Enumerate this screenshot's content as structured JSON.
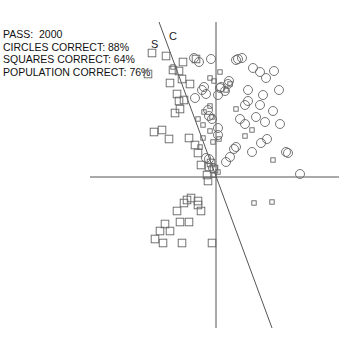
{
  "info": {
    "pass_label": "PASS:",
    "pass_value": "2000",
    "circles_correct": "CIRCLES CORRECT: 88%",
    "squares_correct": "SQUARES CORRECT: 64%",
    "population_correct": "POPULATION CORRECT: 76%"
  },
  "chart_data": {
    "type": "scatter",
    "title": "",
    "xlabel": "",
    "ylabel": "",
    "xlim": [
      -126,
      123
    ],
    "ylim": [
      -151,
      155
    ],
    "grid": false,
    "axes_through_origin": true,
    "decision_boundary": {
      "points": [
        [
          -57,
          155
        ],
        [
          56,
          -151
        ]
      ],
      "side_labels": {
        "left": "S",
        "right": "C"
      }
    },
    "series": [
      {
        "name": "circles",
        "marker": "circle",
        "size": "large",
        "points": [
          [
            -22,
            119
          ],
          [
            -17,
            115
          ],
          [
            -5,
            118
          ],
          [
            22,
            118
          ],
          [
            26,
            119
          ],
          [
            20,
            117
          ],
          [
            37,
            109
          ],
          [
            44,
            105
          ],
          [
            58,
            106
          ],
          [
            50,
            99
          ],
          [
            -12,
            90
          ],
          [
            -14,
            87
          ],
          [
            5,
            90
          ],
          [
            4,
            89
          ],
          [
            13,
            96
          ],
          [
            12,
            93
          ],
          [
            -10,
            83
          ],
          [
            -21,
            79
          ],
          [
            2,
            82
          ],
          [
            32,
            87
          ],
          [
            47,
            82
          ],
          [
            63,
            87
          ],
          [
            9,
            86
          ],
          [
            44,
            72
          ],
          [
            57,
            66
          ],
          [
            40,
            60
          ],
          [
            64,
            53
          ],
          [
            32,
            76
          ],
          [
            29,
            72
          ],
          [
            49,
            55
          ],
          [
            2,
            42
          ],
          [
            24,
            58
          ],
          [
            29,
            53
          ],
          [
            51,
            38
          ],
          [
            45,
            34
          ],
          [
            36,
            25
          ],
          [
            20,
            30
          ],
          [
            18,
            28
          ],
          [
            70,
            25
          ],
          [
            72,
            24
          ],
          [
            -7,
            61
          ],
          [
            -4,
            58
          ],
          [
            -8,
            67
          ],
          [
            2,
            49
          ],
          [
            14,
            20
          ],
          [
            -7,
            18
          ],
          [
            -10,
            19
          ],
          [
            10,
            15
          ],
          [
            -3,
            9
          ],
          [
            84,
            3
          ]
        ]
      },
      {
        "name": "squares",
        "marker": "square",
        "size": "large",
        "points": [
          [
            -64,
            124
          ],
          [
            -50,
            121
          ],
          [
            -33,
            115
          ],
          [
            -20,
            118
          ],
          [
            -37,
            106
          ],
          [
            -43,
            107
          ],
          [
            -68,
            103
          ],
          [
            -46,
            94
          ],
          [
            -34,
            98
          ],
          [
            -26,
            93
          ],
          [
            -39,
            83
          ],
          [
            -32,
            77
          ],
          [
            -37,
            76
          ],
          [
            -36,
            68
          ],
          [
            -41,
            64
          ],
          [
            -54,
            47
          ],
          [
            -62,
            45
          ],
          [
            -47,
            38
          ],
          [
            -27,
            39
          ],
          [
            -21,
            32
          ],
          [
            -18,
            24
          ],
          [
            -15,
            12
          ],
          [
            -5,
            14
          ],
          [
            -7,
            10
          ],
          [
            -2,
            8
          ],
          [
            -9,
            2
          ],
          [
            -8,
            -4
          ],
          [
            -18,
            -24
          ],
          [
            -18,
            -28
          ],
          [
            -29,
            -23
          ],
          [
            -32,
            -26
          ],
          [
            -39,
            -34
          ],
          [
            -15,
            -34
          ],
          [
            -36,
            -45
          ],
          [
            -27,
            -45
          ],
          [
            -51,
            -47
          ],
          [
            -56,
            -54
          ],
          [
            -46,
            -54
          ],
          [
            -61,
            -62
          ],
          [
            -53,
            -66
          ],
          [
            -34,
            -66
          ],
          [
            -4,
            -66
          ],
          [
            -25,
            -21
          ]
        ]
      },
      {
        "name": "small-squares",
        "marker": "square",
        "size": "small",
        "points": [
          [
            -43,
            110
          ],
          [
            4,
            105
          ],
          [
            14,
            93
          ],
          [
            -6,
            99
          ],
          [
            -13,
            52
          ],
          [
            -18,
            58
          ],
          [
            -4,
            60
          ],
          [
            -6,
            71
          ],
          [
            -12,
            65
          ],
          [
            20,
            68
          ],
          [
            -3,
            35
          ],
          [
            -6,
            46
          ],
          [
            36,
            47
          ],
          [
            -13,
            39
          ],
          [
            -16,
            30
          ],
          [
            2,
            5
          ],
          [
            -2,
            2
          ],
          [
            3,
            38
          ],
          [
            29,
            41
          ],
          [
            57,
            17
          ],
          [
            38,
            -26
          ],
          [
            56,
            -25
          ],
          [
            10,
            87
          ],
          [
            -2,
            96
          ]
        ]
      }
    ]
  }
}
